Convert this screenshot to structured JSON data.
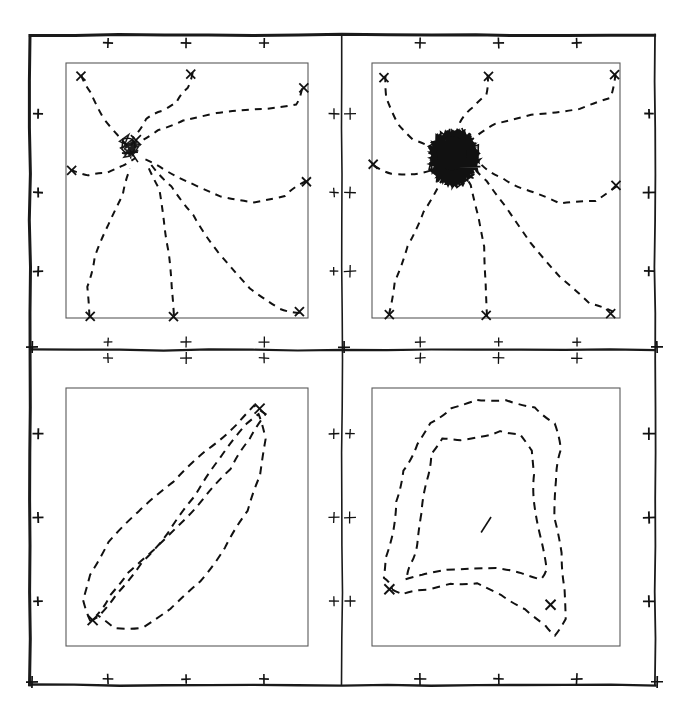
{
  "figure": {
    "type": "multi-panel-trajectory-plot",
    "panel_rows": 2,
    "panel_cols": 2,
    "line_style": "dashed",
    "ink_color": "#111111",
    "frame_color": "#1a1a1a",
    "inner_box_color": "#5a5a5a",
    "background_color": "#ffffff",
    "outer_frame": {
      "x": 30,
      "y": 35,
      "width": 625,
      "height": 650
    },
    "divider_x": 342,
    "divider_y": 350,
    "tick_glyph": "plus-cross",
    "ticks_per_edge_per_panel": 3
  },
  "chart_data": {
    "type": "line",
    "title": "",
    "xlabel": "",
    "ylabel": "",
    "grid": false,
    "legend": null,
    "panels": [
      {
        "id": "panel-top-left",
        "position": "top-left",
        "description": "Eight dashed trajectories converging from the plot boundary toward a single attractor near the upper-left-of-centre, with a small tangled knot at the convergence point",
        "inner_box": {
          "x": 66,
          "y": 63,
          "width": 242,
          "height": 255
        },
        "attractor": {
          "x": 0.26,
          "y": 0.33
        },
        "trajectory_count": 8,
        "cluster_density": "light",
        "markers": [
          "start-x-marks",
          "end-x-marks"
        ],
        "xlim": [
          0,
          1
        ],
        "ylim": [
          0,
          1
        ],
        "trajectories": [
          {
            "name": "t1",
            "points": [
              [
                0.06,
                0.05
              ],
              [
                0.1,
                0.12
              ],
              [
                0.16,
                0.22
              ],
              [
                0.21,
                0.28
              ],
              [
                0.26,
                0.33
              ]
            ]
          },
          {
            "name": "t2",
            "points": [
              [
                0.52,
                0.04
              ],
              [
                0.5,
                0.1
              ],
              [
                0.46,
                0.15
              ],
              [
                0.4,
                0.19
              ],
              [
                0.33,
                0.22
              ],
              [
                0.28,
                0.29
              ]
            ]
          },
          {
            "name": "t3",
            "points": [
              [
                0.98,
                0.1
              ],
              [
                0.95,
                0.16
              ],
              [
                0.82,
                0.18
              ],
              [
                0.62,
                0.2
              ],
              [
                0.48,
                0.23
              ],
              [
                0.38,
                0.26
              ],
              [
                0.3,
                0.31
              ]
            ]
          },
          {
            "name": "t4",
            "points": [
              [
                0.99,
                0.46
              ],
              [
                0.9,
                0.52
              ],
              [
                0.78,
                0.55
              ],
              [
                0.64,
                0.52
              ],
              [
                0.52,
                0.47
              ],
              [
                0.4,
                0.42
              ],
              [
                0.31,
                0.37
              ]
            ]
          },
          {
            "name": "t5",
            "points": [
              [
                0.02,
                0.42
              ],
              [
                0.09,
                0.44
              ],
              [
                0.17,
                0.43
              ],
              [
                0.24,
                0.4
              ],
              [
                0.29,
                0.37
              ]
            ]
          },
          {
            "name": "t6",
            "points": [
              [
                0.1,
                0.99
              ],
              [
                0.09,
                0.88
              ],
              [
                0.12,
                0.76
              ],
              [
                0.17,
                0.64
              ],
              [
                0.23,
                0.52
              ],
              [
                0.27,
                0.41
              ]
            ]
          },
          {
            "name": "t7",
            "points": [
              [
                0.45,
                0.99
              ],
              [
                0.44,
                0.88
              ],
              [
                0.42,
                0.74
              ],
              [
                0.41,
                0.62
              ],
              [
                0.39,
                0.5
              ],
              [
                0.34,
                0.4
              ]
            ]
          },
          {
            "name": "t8",
            "points": [
              [
                0.97,
                0.98
              ],
              [
                0.88,
                0.96
              ],
              [
                0.76,
                0.88
              ],
              [
                0.63,
                0.74
              ],
              [
                0.53,
                0.6
              ],
              [
                0.44,
                0.48
              ],
              [
                0.35,
                0.39
              ]
            ]
          }
        ]
      },
      {
        "id": "panel-top-right",
        "position": "top-right",
        "description": "Same eight converging dashed trajectories but with a very dense black scribble cluster of chattering oscillation at the attractor",
        "inner_box": {
          "x": 372,
          "y": 63,
          "width": 248,
          "height": 255
        },
        "attractor": {
          "x": 0.33,
          "y": 0.37
        },
        "trajectory_count": 8,
        "cluster_density": "very-dense",
        "markers": [
          "start-x-marks",
          "dense-limit-cycle-blob"
        ],
        "xlim": [
          0,
          1
        ],
        "ylim": [
          0,
          1
        ],
        "trajectories": [
          {
            "name": "t1",
            "points": [
              [
                0.05,
                0.05
              ],
              [
                0.06,
                0.14
              ],
              [
                0.1,
                0.24
              ],
              [
                0.17,
                0.3
              ],
              [
                0.26,
                0.34
              ]
            ]
          },
          {
            "name": "t2",
            "points": [
              [
                0.47,
                0.05
              ],
              [
                0.46,
                0.12
              ],
              [
                0.41,
                0.17
              ],
              [
                0.36,
                0.23
              ],
              [
                0.32,
                0.31
              ]
            ]
          },
          {
            "name": "t3",
            "points": [
              [
                0.98,
                0.04
              ],
              [
                0.96,
                0.14
              ],
              [
                0.84,
                0.18
              ],
              [
                0.64,
                0.2
              ],
              [
                0.5,
                0.24
              ],
              [
                0.4,
                0.3
              ]
            ]
          },
          {
            "name": "t4",
            "points": [
              [
                0.99,
                0.48
              ],
              [
                0.9,
                0.54
              ],
              [
                0.76,
                0.55
              ],
              [
                0.62,
                0.5
              ],
              [
                0.52,
                0.45
              ],
              [
                0.44,
                0.4
              ]
            ]
          },
          {
            "name": "t5",
            "points": [
              [
                0.01,
                0.4
              ],
              [
                0.08,
                0.43
              ],
              [
                0.16,
                0.44
              ],
              [
                0.24,
                0.42
              ],
              [
                0.29,
                0.39
              ]
            ]
          },
          {
            "name": "t6",
            "points": [
              [
                0.07,
                0.99
              ],
              [
                0.09,
                0.86
              ],
              [
                0.14,
                0.72
              ],
              [
                0.21,
                0.58
              ],
              [
                0.28,
                0.46
              ],
              [
                0.32,
                0.4
              ]
            ]
          },
          {
            "name": "t7",
            "points": [
              [
                0.46,
                0.99
              ],
              [
                0.46,
                0.86
              ],
              [
                0.45,
                0.72
              ],
              [
                0.43,
                0.6
              ],
              [
                0.4,
                0.48
              ],
              [
                0.37,
                0.42
              ]
            ]
          },
          {
            "name": "t8",
            "points": [
              [
                0.97,
                0.98
              ],
              [
                0.88,
                0.94
              ],
              [
                0.76,
                0.84
              ],
              [
                0.64,
                0.7
              ],
              [
                0.54,
                0.56
              ],
              [
                0.46,
                0.46
              ],
              [
                0.4,
                0.41
              ]
            ]
          }
        ]
      },
      {
        "id": "panel-bottom-left",
        "position": "bottom-left",
        "description": "A narrow elongated dashed loop running diagonally from lower-left to upper-right, traversed as a closed cycle with x-markers at both extreme ends",
        "inner_box": {
          "x": 66,
          "y": 388,
          "width": 242,
          "height": 258
        },
        "trajectory_count": 1,
        "shape": "elongated-diagonal-loop",
        "markers": [
          "x-marker-lower-left",
          "x-marker-upper-right"
        ],
        "xlim": [
          0,
          1
        ],
        "ylim": [
          0,
          1
        ],
        "trajectories": [
          {
            "name": "loop",
            "points": [
              [
                0.1,
                0.9
              ],
              [
                0.07,
                0.82
              ],
              [
                0.1,
                0.72
              ],
              [
                0.18,
                0.6
              ],
              [
                0.3,
                0.48
              ],
              [
                0.44,
                0.36
              ],
              [
                0.58,
                0.24
              ],
              [
                0.7,
                0.14
              ],
              [
                0.78,
                0.07
              ],
              [
                0.82,
                0.1
              ],
              [
                0.76,
                0.2
              ],
              [
                0.68,
                0.31
              ],
              [
                0.58,
                0.42
              ],
              [
                0.47,
                0.53
              ],
              [
                0.36,
                0.63
              ],
              [
                0.26,
                0.72
              ],
              [
                0.18,
                0.8
              ],
              [
                0.13,
                0.88
              ],
              [
                0.2,
                0.93
              ],
              [
                0.32,
                0.93
              ],
              [
                0.43,
                0.86
              ],
              [
                0.55,
                0.75
              ],
              [
                0.66,
                0.62
              ],
              [
                0.75,
                0.48
              ],
              [
                0.8,
                0.34
              ],
              [
                0.82,
                0.2
              ],
              [
                0.8,
                0.1
              ],
              [
                0.74,
                0.14
              ],
              [
                0.64,
                0.27
              ],
              [
                0.53,
                0.42
              ],
              [
                0.42,
                0.56
              ],
              [
                0.31,
                0.68
              ],
              [
                0.21,
                0.8
              ],
              [
                0.13,
                0.89
              ],
              [
                0.1,
                0.9
              ]
            ]
          }
        ]
      },
      {
        "id": "panel-bottom-right",
        "position": "bottom-right",
        "description": "A large rounded closed dashed loop filling most of the panel, double-traced, with x-markers at the left and at the upper-right; a short isolated dash near the centre",
        "inner_box": {
          "x": 372,
          "y": 388,
          "width": 248,
          "height": 258
        },
        "trajectory_count": 1,
        "shape": "large-closed-loop",
        "markers": [
          "x-marker-left",
          "x-marker-upper-right",
          "centre-dash"
        ],
        "xlim": [
          0,
          1
        ],
        "ylim": [
          0,
          1
        ],
        "trajectories": [
          {
            "name": "loop",
            "points": [
              [
                0.08,
                0.78
              ],
              [
                0.12,
                0.8
              ],
              [
                0.22,
                0.78
              ],
              [
                0.32,
                0.76
              ],
              [
                0.42,
                0.76
              ],
              [
                0.52,
                0.8
              ],
              [
                0.62,
                0.86
              ],
              [
                0.7,
                0.92
              ],
              [
                0.74,
                0.96
              ],
              [
                0.78,
                0.9
              ],
              [
                0.78,
                0.78
              ],
              [
                0.76,
                0.64
              ],
              [
                0.74,
                0.5
              ],
              [
                0.74,
                0.36
              ],
              [
                0.76,
                0.24
              ],
              [
                0.74,
                0.14
              ],
              [
                0.66,
                0.08
              ],
              [
                0.54,
                0.05
              ],
              [
                0.42,
                0.05
              ],
              [
                0.32,
                0.08
              ],
              [
                0.24,
                0.14
              ],
              [
                0.18,
                0.22
              ],
              [
                0.13,
                0.32
              ],
              [
                0.1,
                0.44
              ],
              [
                0.08,
                0.56
              ],
              [
                0.06,
                0.66
              ],
              [
                0.05,
                0.74
              ],
              [
                0.08,
                0.78
              ]
            ]
          },
          {
            "name": "loop-inner",
            "points": [
              [
                0.14,
                0.74
              ],
              [
                0.2,
                0.72
              ],
              [
                0.3,
                0.7
              ],
              [
                0.4,
                0.7
              ],
              [
                0.5,
                0.7
              ],
              [
                0.6,
                0.72
              ],
              [
                0.68,
                0.74
              ],
              [
                0.7,
                0.7
              ],
              [
                0.68,
                0.58
              ],
              [
                0.66,
                0.46
              ],
              [
                0.65,
                0.34
              ],
              [
                0.64,
                0.24
              ],
              [
                0.6,
                0.18
              ],
              [
                0.52,
                0.17
              ],
              [
                0.44,
                0.19
              ],
              [
                0.36,
                0.2
              ],
              [
                0.28,
                0.2
              ],
              [
                0.24,
                0.26
              ],
              [
                0.22,
                0.36
              ],
              [
                0.2,
                0.48
              ],
              [
                0.18,
                0.6
              ],
              [
                0.16,
                0.68
              ],
              [
                0.14,
                0.74
              ]
            ]
          }
        ]
      }
    ]
  }
}
